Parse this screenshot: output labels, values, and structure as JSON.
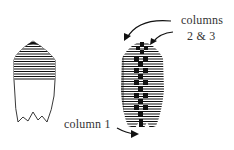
{
  "figure": {
    "labels": {
      "columns_line1": "columns",
      "columns_line2": "2 & 3",
      "column1": "column 1"
    },
    "shells": [
      {
        "id": "left",
        "description": "shell outline with striped upper portion and blank lower body"
      },
      {
        "id": "right",
        "description": "fully striped shell with central column of black squares"
      }
    ],
    "colors": {
      "ink": "#111111",
      "background": "#ffffff",
      "text": "#333333"
    }
  }
}
